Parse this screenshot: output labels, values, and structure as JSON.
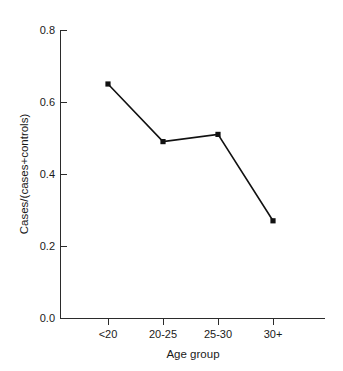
{
  "chart_data": {
    "type": "line",
    "title": "",
    "subtitle": "",
    "xlabel": "Age group",
    "ylabel": "Cases/(cases+controls)",
    "categories": [
      "<20",
      "20-25",
      "25-30",
      "30+"
    ],
    "values": [
      0.65,
      0.49,
      0.51,
      0.27
    ],
    "series": [
      {
        "name": "Cases/(cases+controls)",
        "values": [
          0.65,
          0.49,
          0.51,
          0.27
        ]
      }
    ],
    "ylim": [
      0.0,
      0.8
    ],
    "ytick_labels": [
      "0.0",
      "0.2",
      "0.4",
      "0.6",
      "0.8"
    ],
    "ytick_values": [
      0.0,
      0.2,
      0.4,
      0.6,
      0.8
    ],
    "xtick_labels": [
      "<20",
      "20-25",
      "25-30",
      "30+"
    ],
    "grid": false,
    "legend": "none",
    "marker": "filled-square",
    "line_color": "#111111",
    "marker_color": "#111111",
    "background_color": "#ffffff"
  },
  "axes": {
    "y_title": "Cases/(cases+controls)",
    "x_title": "Age group",
    "y_ticks": [
      {
        "label": "0.8",
        "value": 0.8
      },
      {
        "label": "0.6",
        "value": 0.6
      },
      {
        "label": "0.4",
        "value": 0.4
      },
      {
        "label": "0.2",
        "value": 0.2
      },
      {
        "label": "0.0",
        "value": 0.0
      }
    ],
    "x_ticks": [
      {
        "label": "<20"
      },
      {
        "label": "20-25"
      },
      {
        "label": "25-30"
      },
      {
        "label": "30+"
      }
    ]
  }
}
